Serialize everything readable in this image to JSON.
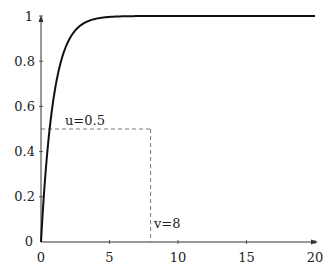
{
  "chart_data": {
    "type": "line",
    "title": "",
    "xlabel": "",
    "ylabel": "",
    "xlim": [
      0,
      20
    ],
    "ylim": [
      0,
      1
    ],
    "x_ticks": [
      "0",
      "5",
      "10",
      "15",
      "20"
    ],
    "y_ticks": [
      "0",
      "0.2",
      "0.4",
      "0.6",
      "0.8",
      "1"
    ],
    "grid": false,
    "legend": null,
    "series": [
      {
        "name": "curve",
        "function": "1 - exp(-1.1 x)",
        "x": [
          0,
          0.25,
          0.5,
          0.65,
          1,
          1.5,
          2,
          3,
          4,
          5,
          6,
          8,
          10,
          15,
          20
        ],
        "y": [
          0,
          0.24,
          0.42,
          0.5,
          0.67,
          0.81,
          0.89,
          0.96,
          0.99,
          1.0,
          1.0,
          1.0,
          1.0,
          1.0,
          1.0
        ]
      }
    ],
    "annotations": [
      {
        "text": "u=0.5",
        "type": "dashed-horizontal",
        "y": 0.5,
        "x_from": 0,
        "x_to": 8
      },
      {
        "text": "v=8",
        "type": "dashed-vertical",
        "x": 8,
        "y_from": 0,
        "y_to": 0.5
      }
    ]
  },
  "labels": {
    "u": "u=0.5",
    "v": "v=8",
    "x0": "0",
    "x5": "5",
    "x10": "10",
    "x15": "15",
    "x20": "20",
    "y0": "0",
    "y02": "0.2",
    "y04": "0.4",
    "y06": "0.6",
    "y08": "0.8",
    "y1": "1"
  }
}
